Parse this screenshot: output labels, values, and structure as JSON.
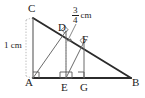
{
  "figure": {
    "type": "geometry-diagram",
    "canvas": {
      "width": 145,
      "height": 98
    },
    "colors": {
      "stroke": "#3a3a3a",
      "heavy_stroke": "#2b2b2b",
      "light_stroke": "#8c8c8c",
      "dotted_stroke": "#9a9a9a",
      "text": "#1c1c1c",
      "background": "#ffffff"
    },
    "vertices": [
      {
        "name": "A",
        "label": "A",
        "x": 33,
        "y": 78
      },
      {
        "name": "B",
        "label": "B",
        "x": 131,
        "y": 78
      },
      {
        "name": "C",
        "label": "C",
        "x": 33,
        "y": 18
      },
      {
        "name": "D",
        "label": "D",
        "x": 66,
        "y": 31
      },
      {
        "name": "E",
        "label": "E",
        "x": 66,
        "y": 78
      },
      {
        "name": "F",
        "label": "F",
        "x": 84,
        "y": 42
      },
      {
        "name": "G",
        "label": "G",
        "x": 84,
        "y": 78
      }
    ],
    "vertex_label_positions": [
      {
        "name": "A",
        "label": "A",
        "left": 25,
        "top": 77
      },
      {
        "name": "B",
        "label": "B",
        "left": 132,
        "top": 77
      },
      {
        "name": "C",
        "label": "C",
        "left": 28,
        "top": 3
      },
      {
        "name": "D",
        "label": "D",
        "left": 58,
        "top": 22
      },
      {
        "name": "E",
        "label": "E",
        "left": 61,
        "top": 82
      },
      {
        "name": "F",
        "label": "F",
        "left": 82,
        "top": 34
      },
      {
        "name": "G",
        "label": "G",
        "left": 80,
        "top": 82
      }
    ],
    "segments": [
      {
        "name": "side-CB-hypotenuse",
        "from": "C",
        "to": "B",
        "style": "heavy"
      },
      {
        "name": "side-AB-base",
        "from": "A",
        "to": "B",
        "style": "heavy"
      },
      {
        "name": "side-CA-vertical",
        "from": "C",
        "to": "A",
        "style": "normal"
      },
      {
        "name": "segment-AD",
        "from": "A",
        "to": "D",
        "style": "normal"
      },
      {
        "name": "segment-DE",
        "from": "D",
        "to": "E",
        "style": "normal"
      },
      {
        "name": "segment-EF",
        "from": "E",
        "to": "F",
        "style": "normal"
      },
      {
        "name": "segment-FG",
        "from": "F",
        "to": "G",
        "style": "normal"
      }
    ],
    "right_angle_marks": [
      {
        "name": "right-angle-at-A",
        "at": "A"
      },
      {
        "name": "right-angle-at-E",
        "at": "E"
      },
      {
        "name": "right-angle-at-G",
        "at": "G"
      },
      {
        "name": "right-angle-at-D",
        "at": "D"
      },
      {
        "name": "right-angle-at-F",
        "at": "F"
      }
    ],
    "measurements": [
      {
        "name": "height-measure",
        "label": "1 cm",
        "kind": "plain",
        "left": 4,
        "top": 41,
        "guide": {
          "x": 26,
          "y1": 20,
          "y2": 76
        }
      },
      {
        "name": "segment-DF-measure",
        "kind": "fraction",
        "numerator": "3",
        "denominator": "4",
        "unit": "cm",
        "left": 72,
        "top": 6,
        "leader": {
          "x1": 76,
          "y1": 24,
          "x2": 67,
          "y2": 42
        }
      }
    ]
  }
}
